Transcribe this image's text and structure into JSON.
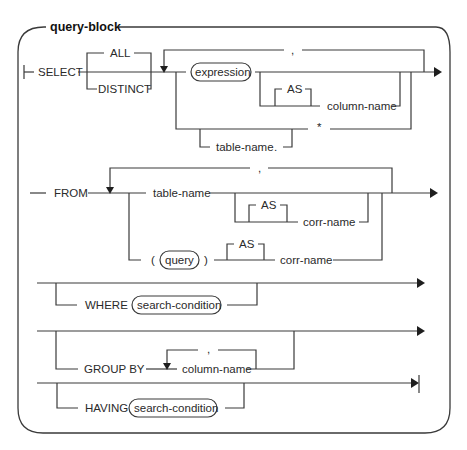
{
  "diagram": {
    "title": "query-block",
    "type": "syntax-railroad-diagram",
    "colors": {
      "line": "#3a3a3a",
      "text": "#2a2a2a",
      "background": "#ffffff"
    },
    "select_clause": {
      "keyword": "SELECT",
      "quantifiers": [
        "ALL",
        "DISTINCT"
      ],
      "repeat_separator": ",",
      "expression": "expression",
      "as_keyword": "AS",
      "column_name": "column-name",
      "star": "*",
      "table_name": "table-name",
      "dot": "."
    },
    "from_clause": {
      "keyword": "FROM",
      "repeat_separator": ",",
      "table_name": "table-name",
      "as_keyword_1": "AS",
      "corr_name_1": "corr-name",
      "open_paren": "(",
      "query": "query",
      "close_paren": ")",
      "as_keyword_2": "AS",
      "corr_name_2": "corr-name"
    },
    "where_clause": {
      "keyword": "WHERE",
      "condition": "search-condition"
    },
    "group_by_clause": {
      "keyword": "GROUP BY",
      "repeat_separator": ",",
      "column_name": "column-name"
    },
    "having_clause": {
      "keyword": "HAVING",
      "condition": "search-condition"
    }
  }
}
